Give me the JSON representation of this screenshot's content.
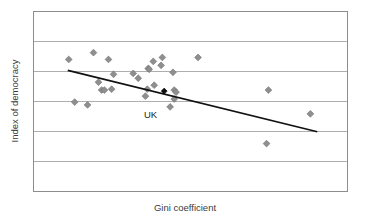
{
  "chart_data": {
    "type": "scatter",
    "title": "",
    "xlabel": "Gini coefficient",
    "ylabel": "Index of democracy",
    "grid": true,
    "gridlines_horizontal": 5,
    "legend": "none",
    "xtick_labels": [],
    "ytick_labels": [],
    "axis_note": "Axes are unlabelled; only horizontal gridlines are drawn",
    "xlim": [
      0,
      100
    ],
    "ylim": [
      0,
      100
    ],
    "series": [
      {
        "name": "Countries",
        "marker": "diamond",
        "color": "#8f8f8f",
        "points": [
          {
            "x": 11.1,
            "y": 73.5
          },
          {
            "x": 19.0,
            "y": 77.3
          },
          {
            "x": 23.8,
            "y": 73.5
          },
          {
            "x": 25.4,
            "y": 65.2
          },
          {
            "x": 20.6,
            "y": 60.8
          },
          {
            "x": 33.3,
            "y": 63.0
          },
          {
            "x": 36.5,
            "y": 68.5
          },
          {
            "x": 36.8,
            "y": 68.0
          },
          {
            "x": 40.6,
            "y": 70.2
          },
          {
            "x": 38.1,
            "y": 72.4
          },
          {
            "x": 44.4,
            "y": 66.3
          },
          {
            "x": 41.0,
            "y": 74.6
          },
          {
            "x": 52.4,
            "y": 74.6
          },
          {
            "x": 31.7,
            "y": 65.7
          },
          {
            "x": 21.6,
            "y": 56.4
          },
          {
            "x": 22.5,
            "y": 56.4
          },
          {
            "x": 24.8,
            "y": 56.9
          },
          {
            "x": 36.2,
            "y": 56.9
          },
          {
            "x": 38.4,
            "y": 59.1
          },
          {
            "x": 44.8,
            "y": 56.4
          },
          {
            "x": 45.4,
            "y": 55.2
          },
          {
            "x": 35.6,
            "y": 53.0
          },
          {
            "x": 44.8,
            "y": 51.4
          },
          {
            "x": 13.0,
            "y": 49.7
          },
          {
            "x": 17.1,
            "y": 48.1
          },
          {
            "x": 43.5,
            "y": 47.0
          },
          {
            "x": 74.9,
            "y": 56.4
          },
          {
            "x": 88.3,
            "y": 43.1
          },
          {
            "x": 74.3,
            "y": 26.5
          }
        ]
      },
      {
        "name": "UK",
        "marker": "diamond",
        "color": "#111111",
        "label": "UK",
        "points": [
          {
            "x": 41.6,
            "y": 55.8
          }
        ]
      }
    ],
    "trendline": {
      "type": "linear",
      "color": "#111111",
      "x_start": 10.8,
      "y_start": 67.4,
      "x_end": 90.5,
      "y_end": 33.1
    }
  },
  "labels": {
    "uk": "UK"
  }
}
